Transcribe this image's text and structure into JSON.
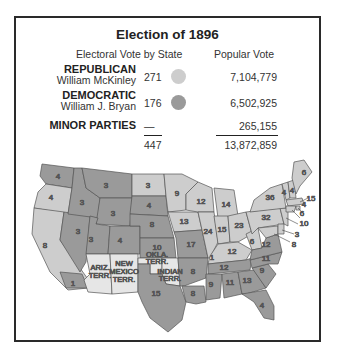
{
  "title": "Election of 1896",
  "headers": {
    "electoral": "Electoral Vote by State",
    "popular": "Popular Vote"
  },
  "colors": {
    "republican": "#cdcdcd",
    "democratic": "#9a9a9a",
    "territory": "#e6e6e6",
    "border": "#555555"
  },
  "parties": [
    {
      "name": "REPUBLICAN",
      "candidate": "William McKinley",
      "electoral": "271",
      "popular": "7,104,779",
      "swatch": "light-gray"
    },
    {
      "name": "DEMOCRATIC",
      "candidate": "William J. Bryan",
      "electoral": "176",
      "popular": "6,502,925",
      "swatch": "dark-gray"
    },
    {
      "name": "MINOR PARTIES",
      "candidate": "",
      "electoral": "—",
      "popular": "265,155"
    }
  ],
  "totals": {
    "electoral": "447",
    "popular": "13,872,859"
  },
  "map": {
    "states": {
      "WA": "4",
      "OR": "4",
      "CA": "8",
      "CA_dem": "1",
      "ID": "3",
      "NV": "3",
      "MT": "3",
      "WY": "3",
      "UT": "3",
      "CO": "4",
      "ND": "3",
      "SD": "4",
      "NE": "8",
      "KS": "10",
      "MN": "9",
      "IA": "13",
      "MO": "17",
      "WI": "12",
      "IL": "24",
      "MI": "14",
      "IN": "15",
      "OH": "23",
      "KY": "12",
      "KY_dem": "1",
      "TN": "12",
      "AR": "8",
      "LA": "8",
      "MS": "9",
      "AL": "11",
      "GA": "13",
      "FL": "4",
      "SC": "9",
      "NC": "11",
      "VA": "12",
      "WV": "6",
      "PA": "32",
      "NY": "36",
      "ME": "6",
      "NH": "4",
      "VT": "4",
      "MA": "15",
      "RI": "4",
      "CT": "6",
      "NJ": "10",
      "DE": "3",
      "MD": "8",
      "TX": "15"
    },
    "territories": {
      "AZ": "ARIZ. TERR.",
      "NM": [
        "NEW",
        "MEXICO",
        "TERR."
      ],
      "OK": [
        "OKLA.",
        "TERR."
      ],
      "IT": [
        "INDIAN",
        "TERR."
      ]
    }
  }
}
